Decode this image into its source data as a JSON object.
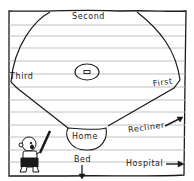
{
  "diagram": {
    "kind": "hand-drawn baseball field on lined paper",
    "colors": {
      "ink": "#1a1a1a",
      "paper": "#ffffff",
      "ruled_line": "#b8b8b8"
    },
    "labels": {
      "second": "Second",
      "third": "Third",
      "first": "First",
      "home": "Home",
      "recliner": "Recliner",
      "bed": "Bed",
      "hospital": "Hospital"
    },
    "elements": {
      "pitchers_mound": "pitchers-mound",
      "batter": "cartoon-kid-with-bat",
      "arrows": [
        "recliner-arrow",
        "bed-arrow",
        "hospital-arrow"
      ]
    }
  }
}
